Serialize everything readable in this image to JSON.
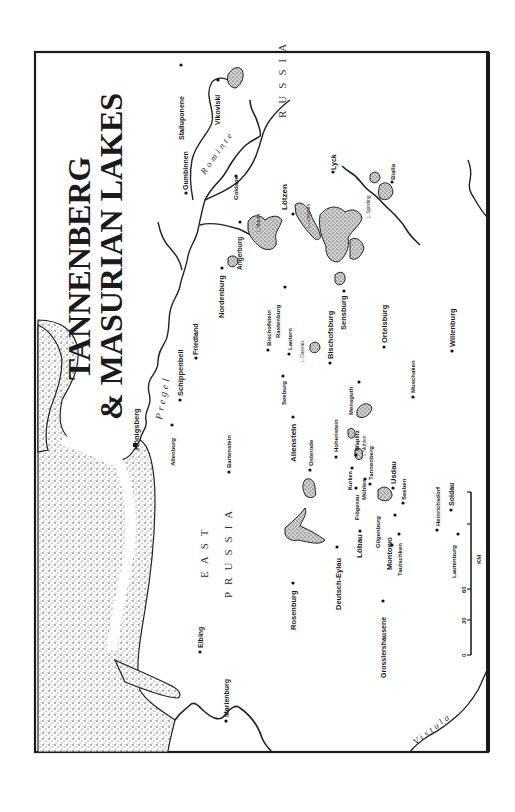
{
  "title": {
    "line1": "TANNENBERG",
    "line2": "& MASURIAN LAKES"
  },
  "regions": {
    "east_prussia_1": "EAST",
    "east_prussia_2": "PRUSSIA",
    "russia": "RUSSIA"
  },
  "rivers": {
    "pregel": "Pregel",
    "rominte": "Rominte",
    "vistula": "Vistula"
  },
  "lakes": {
    "mauer": "L.Mauer",
    "lowentin": "L.Lowentin",
    "spirding": "L.Spirding",
    "dassau": "L.Dassau",
    "muhlen": "L.Mühlen"
  },
  "towns": {
    "stalluponene": "Stalluponene",
    "gumbinnen": "Gumbinnen",
    "vikoviski": "Vikoviski",
    "goldape": "Goldape",
    "lotzen": "Lötzen",
    "lyck": "Lyck",
    "bialla": "Bialla",
    "angerburg": "Angerburg",
    "nordenburg": "Nordenburg",
    "friedland": "Friedland",
    "schippenbeil": "Schippenbeil",
    "konigsberg": "Königsberg",
    "allenburg": "Allenburg",
    "bartenstein": "Bartenstein",
    "bischofstein": "Bischofstein",
    "rastenburg": "Rastenburg",
    "lautern": "Lautern",
    "seeburg": "Seeburg",
    "bischofsburg": "Bischofsburg",
    "sensburg": "Sensburg",
    "ortelsburg": "Ortelsburg",
    "allenstein": "Allenstein",
    "osterode": "Osterode",
    "hohenstein": "Hohenstein",
    "mensguth": "Mensguth",
    "muschaken": "Muschaken",
    "willenburg": "Willenburg",
    "waplitz": "Waplitz",
    "tannenberg": "Tannenberg",
    "kurken": "Kurken",
    "frogenau": "Frögenau",
    "muhlen": "Mühlen",
    "usdau": "Usdau",
    "seeben": "Seeben",
    "gilgenburg": "Gilgenburg",
    "lobau": "Löbau",
    "montowo": "Montowo",
    "tautschken": "Tautschken",
    "heinrichsdorf": "Heinrichsdorf",
    "soldau": "Soldau",
    "lautenburg": "Lautenburg",
    "deutsch_eylau": "Deutsch-Eylau",
    "rosenburg": "Rosenburg",
    "grosslershausene": "Grosslershausene",
    "elbing": "Elbing",
    "marienburg": "Marienburg"
  },
  "scale": {
    "ticks": [
      "0",
      "30",
      "60"
    ],
    "unit": "KM"
  }
}
